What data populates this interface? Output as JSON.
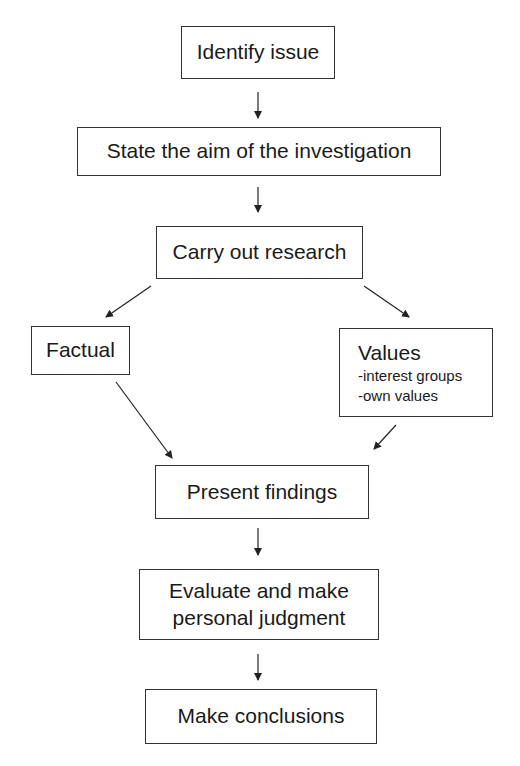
{
  "diagram": {
    "type": "flowchart",
    "nodes": [
      {
        "id": "identify",
        "label": "Identify issue"
      },
      {
        "id": "aim",
        "label": "State the aim of the investigation"
      },
      {
        "id": "research",
        "label": "Carry out research"
      },
      {
        "id": "factual",
        "label": "Factual"
      },
      {
        "id": "values",
        "label": "Values",
        "items": [
          "-interest groups",
          "-own values"
        ]
      },
      {
        "id": "present",
        "label": "Present findings"
      },
      {
        "id": "evaluate",
        "label_line1": "Evaluate and make",
        "label_line2": "personal judgment"
      },
      {
        "id": "conclude",
        "label": "Make conclusions"
      }
    ],
    "edges": [
      {
        "from": "identify",
        "to": "aim"
      },
      {
        "from": "aim",
        "to": "research"
      },
      {
        "from": "research",
        "to": "factual"
      },
      {
        "from": "research",
        "to": "values"
      },
      {
        "from": "factual",
        "to": "present"
      },
      {
        "from": "values",
        "to": "present"
      },
      {
        "from": "present",
        "to": "evaluate"
      },
      {
        "from": "evaluate",
        "to": "conclude"
      }
    ]
  }
}
